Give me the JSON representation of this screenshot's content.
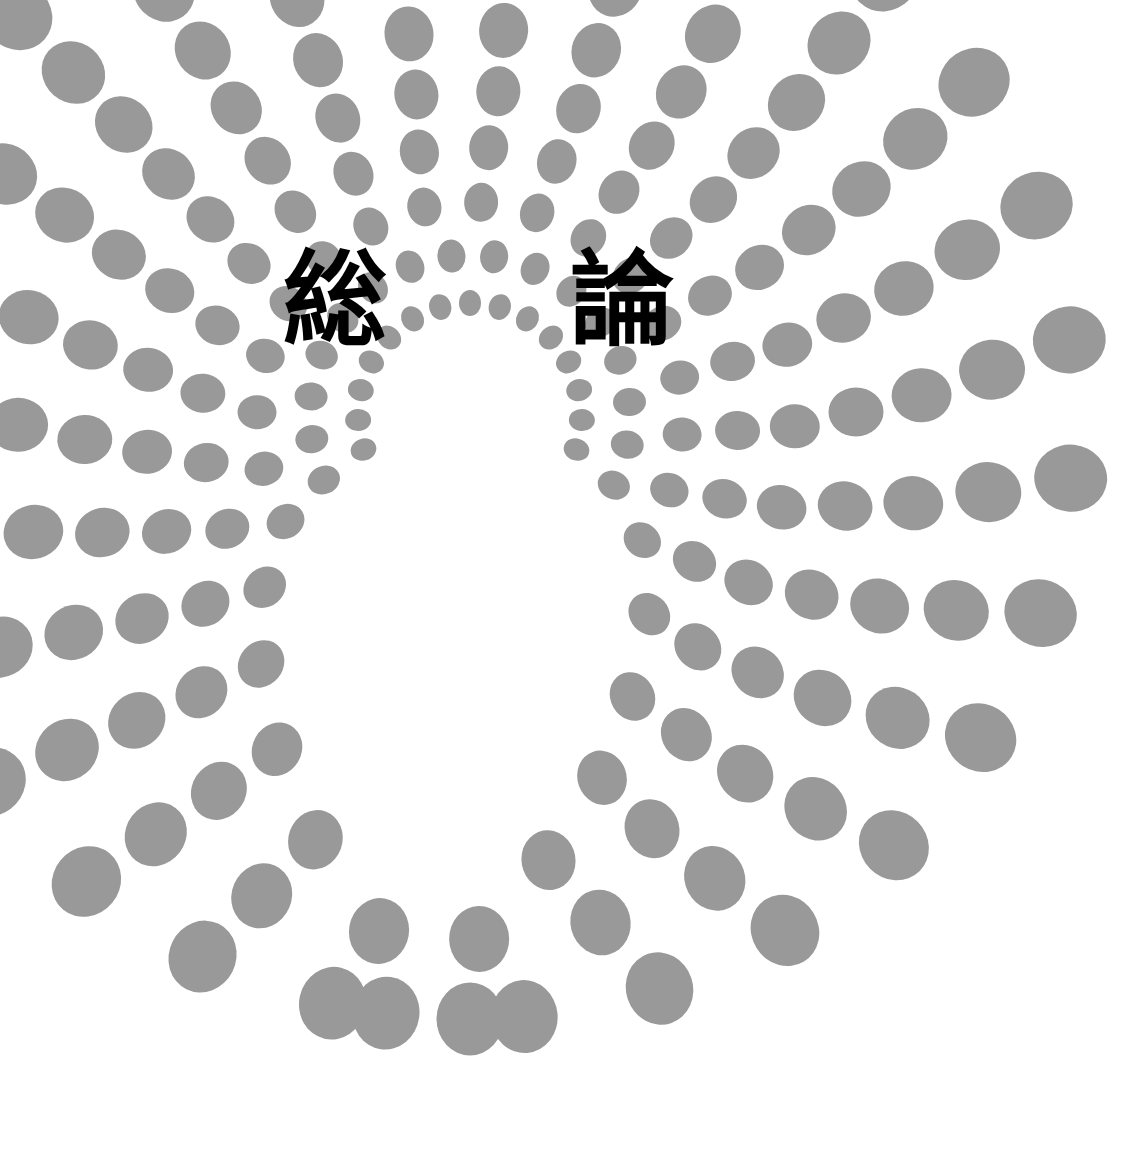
{
  "page": {
    "kind": "book-section-divider",
    "language": "ja",
    "width": 1144,
    "height": 1150,
    "background_color": "#ffffff"
  },
  "title": {
    "full_text": "総論",
    "romaji": "soron",
    "char_1": "総",
    "char_2": "論",
    "color": "#000000"
  },
  "decoration": {
    "name": "concentric-dotted-arcs",
    "dot_color": "#999999",
    "dot_shape": "ellipse",
    "description": "Nested horseshoe arcs of gray ellipses, dots grow larger with radius",
    "center_x": 470,
    "center_y": 415,
    "arc_count": 9,
    "arcs": [
      {
        "index": 0,
        "radius": 112,
        "dot_rx": 11,
        "dot_ry": 13,
        "angle_start": -108,
        "angle_end": 108,
        "count": 15
      },
      {
        "index": 1,
        "radius": 160,
        "dot_rx": 14,
        "dot_ry": 16.5,
        "angle_start": -114,
        "angle_end": 116,
        "count": 16
      },
      {
        "index": 2,
        "radius": 213,
        "dot_rx": 17,
        "dot_ry": 19.5,
        "angle_start": -120,
        "angle_end": 126,
        "count": 17
      },
      {
        "index": 3,
        "radius": 268,
        "dot_rx": 19.5,
        "dot_ry": 22.5,
        "angle_start": -130,
        "angle_end": 138,
        "count": 19
      },
      {
        "index": 4,
        "radius": 325,
        "dot_rx": 22,
        "dot_ry": 25,
        "angle_start": -140,
        "angle_end": 150,
        "count": 21
      },
      {
        "index": 5,
        "radius": 386,
        "dot_rx": 24.5,
        "dot_ry": 27.5,
        "angle_start": -150,
        "angle_end": 160,
        "count": 23
      },
      {
        "index": 6,
        "radius": 452,
        "dot_rx": 27,
        "dot_ry": 30,
        "angle_start": -160,
        "angle_end": 170,
        "count": 25
      },
      {
        "index": 7,
        "radius": 524,
        "dot_rx": 30,
        "dot_ry": 33,
        "angle_start": -170,
        "angle_end": 179,
        "count": 27
      },
      {
        "index": 8,
        "radius": 604,
        "dot_rx": 33.5,
        "dot_ry": 36.5,
        "angle_start": -180,
        "angle_end": 188,
        "count": 29
      }
    ]
  }
}
